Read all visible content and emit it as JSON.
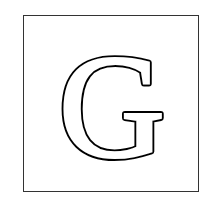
{
  "logo": {
    "letter": "G",
    "stroke_color": "#000000",
    "fill_color": "#ffffff",
    "frame_color": "#333333"
  }
}
